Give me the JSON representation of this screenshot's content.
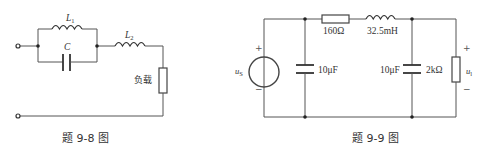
{
  "figure_9_8": {
    "caption": "题 9-8 图",
    "components": {
      "L1": {
        "symbol": "L",
        "subscript": "1",
        "type": "inductor"
      },
      "C": {
        "symbol": "C",
        "type": "capacitor"
      },
      "L2": {
        "symbol": "L",
        "subscript": "2",
        "type": "inductor"
      },
      "load": {
        "label": "负载",
        "type": "resistor-box"
      }
    },
    "topology": "L1 parallel C, in series with L2, feeding load"
  },
  "figure_9_9": {
    "caption": "题 9-9 图",
    "source": {
      "symbol": "u",
      "subscript": "S",
      "plus": "+",
      "minus": "−"
    },
    "c1": {
      "value": "10μF"
    },
    "r1": {
      "value": "160Ω"
    },
    "l1": {
      "value": "32.5mH"
    },
    "c2": {
      "value": "10μF"
    },
    "rl": {
      "value": "2kΩ"
    },
    "output": {
      "symbol": "u",
      "subscript": "l",
      "plus": "+",
      "minus": "−"
    }
  }
}
